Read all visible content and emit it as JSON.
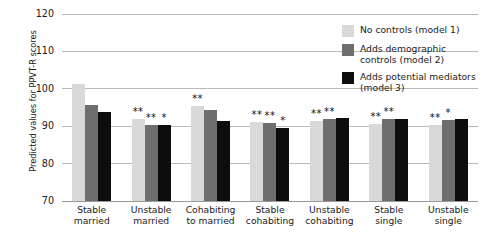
{
  "chart_data": {
    "type": "bar",
    "title": "",
    "xlabel": "",
    "ylabel": "Predicted values for PPVT-R scores",
    "ylim": [
      70,
      120
    ],
    "yticks": [
      70,
      80,
      90,
      100,
      110,
      120
    ],
    "grid": true,
    "legend_position": "right",
    "categories": [
      "Stable married",
      "Unstable married",
      "Cohabiting to married",
      "Stable cohabiting",
      "Unstable cohabiting",
      "Stable single",
      "Unstable single"
    ],
    "category_lines": [
      [
        "Stable",
        "married"
      ],
      [
        "Unstable",
        "married"
      ],
      [
        "Cohabiting",
        "to married"
      ],
      [
        "Stable",
        "cohabiting"
      ],
      [
        "Unstable",
        "cohabiting"
      ],
      [
        "Stable",
        "single"
      ],
      [
        "Unstable",
        "single"
      ]
    ],
    "series": [
      {
        "name": "No controls (model 1)",
        "color": "#d9d9d9",
        "values": [
          101.2,
          92.0,
          95.5,
          91.2,
          91.5,
          90.5,
          90.3
        ],
        "significance": [
          "",
          "**",
          "**",
          "**",
          "**",
          "**",
          "**"
        ]
      },
      {
        "name": "Adds demographic controls (model 2)",
        "color": "#6e6e6e",
        "values": [
          95.6,
          90.2,
          94.3,
          90.8,
          92.0,
          91.8,
          91.6
        ],
        "significance": [
          "",
          "**",
          "",
          "**",
          "**",
          "**",
          "*"
        ]
      },
      {
        "name": "Adds potential mediators (model 3)",
        "color": "#0d0d0d",
        "values": [
          93.7,
          90.3,
          91.4,
          89.6,
          92.2,
          92.0,
          91.9
        ],
        "significance": [
          "",
          "*",
          "",
          "*",
          "",
          "",
          ""
        ]
      }
    ]
  },
  "legend": {
    "entries": [
      {
        "label": "No controls (model 1)",
        "color": "#d9d9d9"
      },
      {
        "label": "Adds demographic controls (model 2)",
        "color": "#6e6e6e"
      },
      {
        "label": "Adds potential mediators (model 3)",
        "color": "#0d0d0d"
      }
    ]
  },
  "axis": {
    "y_title": "Predicted values for PPVT-R scores",
    "y_ticks": [
      "120",
      "110",
      "100",
      "90",
      "80",
      "70"
    ]
  }
}
